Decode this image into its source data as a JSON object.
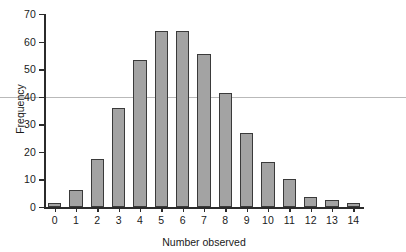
{
  "chart_data": {
    "type": "bar",
    "title": "",
    "xlabel": "Number observed",
    "ylabel": "Frequency",
    "categories": [
      "0",
      "1",
      "2",
      "3",
      "4",
      "5",
      "6",
      "7",
      "8",
      "9",
      "10",
      "11",
      "12",
      "13",
      "14"
    ],
    "values": [
      1.5,
      6,
      17.5,
      36,
      53.5,
      64,
      64,
      55.5,
      41.5,
      27,
      16.5,
      10,
      3.5,
      2.5,
      1.5
    ],
    "ylim": [
      0,
      70
    ],
    "yticks": [
      "0",
      "10",
      "20",
      "30",
      "40",
      "50",
      "60",
      "70"
    ],
    "ytick_values": [
      0,
      10,
      20,
      30,
      40,
      50,
      60,
      70
    ],
    "grid": false,
    "reference_line": 40,
    "legend": null,
    "legend_position": "none",
    "colors": {
      "bar_fill": "#a3a3a3",
      "bar_border": "#3a3a3a",
      "axis": "#2b2b2b",
      "reference_line": "#b9b9b9",
      "text": "#1a1a1a",
      "background": "#ffffff"
    }
  }
}
